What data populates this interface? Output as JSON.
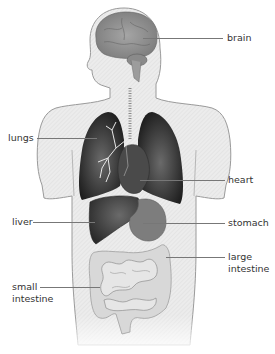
{
  "diagram": {
    "type": "anatomical-organs",
    "colors": {
      "body_fill": "#ececec",
      "body_outline": "#9a9a9a",
      "brain": "#8f8f8f",
      "lungs": "#2b2b2b",
      "heart": "#4a4a4a",
      "liver": "#3e3e3e",
      "stomach": "#7d7d7d",
      "intestine": "#d8d8d8",
      "label_text": "#333333",
      "leader_line": "#777777"
    }
  },
  "labels": {
    "brain": "brain",
    "lungs": "lungs",
    "heart": "heart",
    "liver": "liver",
    "stomach": "stomach",
    "large_intestine": "large\nintestine",
    "small_intestine": "small\nintestine"
  }
}
